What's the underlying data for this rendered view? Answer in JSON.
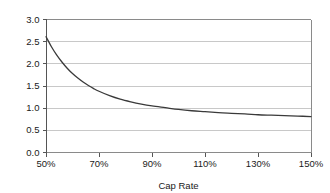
{
  "chart_data": {
    "type": "line",
    "title": "",
    "subtitle": "",
    "xlabel": "Cap Rate",
    "ylabel": "",
    "xlim": [
      50,
      150
    ],
    "ylim": [
      0.0,
      3.0
    ],
    "grid": true,
    "legend": false,
    "legend_position": "none",
    "x_tick_labels": [
      "50%",
      "70%",
      "90%",
      "110%",
      "130%",
      "150%"
    ],
    "x_tick_values": [
      50,
      70,
      90,
      110,
      130,
      150
    ],
    "y_tick_labels": [
      "0.0",
      "0.5",
      "1.0",
      "1.5",
      "2.0",
      "2.5",
      "3.0"
    ],
    "y_tick_values": [
      0.0,
      0.5,
      1.0,
      1.5,
      2.0,
      2.5,
      3.0
    ],
    "series": [
      {
        "name": "Value",
        "color": "#3a3a3a",
        "x": [
          50,
          52,
          54,
          56,
          58,
          60,
          62,
          64,
          66,
          68,
          70,
          74,
          78,
          82,
          86,
          90,
          95,
          100,
          105,
          110,
          115,
          120,
          125,
          130,
          135,
          140,
          145,
          150
        ],
        "values": [
          2.6,
          2.38,
          2.19,
          2.03,
          1.89,
          1.77,
          1.67,
          1.58,
          1.5,
          1.43,
          1.37,
          1.27,
          1.19,
          1.13,
          1.08,
          1.04,
          1.0,
          0.96,
          0.93,
          0.91,
          0.89,
          0.87,
          0.86,
          0.84,
          0.83,
          0.82,
          0.81,
          0.8
        ]
      }
    ],
    "colors": {
      "series_line": "#3a3a3a",
      "gridline": "#c8c8c8",
      "axis": "#555555",
      "frame": "#8a8a8a",
      "text": "#1a1a1a",
      "background": "#ffffff"
    }
  }
}
